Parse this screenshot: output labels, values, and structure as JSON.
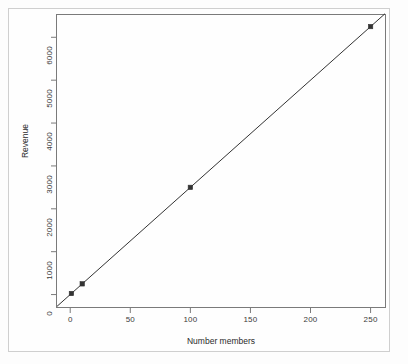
{
  "chart_data": {
    "type": "scatter",
    "title": "",
    "xlabel": "Number members",
    "ylabel": "Revenue",
    "xlim": [
      -11,
      262
    ],
    "ylim": [
      -290,
      6520
    ],
    "xticks": [
      "0",
      "50",
      "100",
      "150",
      "200",
      "250"
    ],
    "xtick_values": [
      0,
      50,
      100,
      150,
      200,
      250
    ],
    "yticks": [
      "0",
      "1000",
      "2000",
      "3000",
      "4000",
      "5000",
      "6000"
    ],
    "ytick_values": [
      0,
      1000,
      2000,
      3000,
      4000,
      5000,
      6000
    ],
    "grid": false,
    "legend": null,
    "series": [
      {
        "name": "Revenue",
        "x": [
          1,
          10,
          100,
          250
        ],
        "y": [
          25,
          250,
          2500,
          6250
        ],
        "marker": "filled-square",
        "line": "solid",
        "color": "#333333"
      }
    ],
    "trendline": {
      "type": "linear",
      "slope": 25,
      "intercept": 0,
      "color": "#333333"
    }
  },
  "figure": {
    "frame_color": "#cfcfcf",
    "axis_color": "#7a7a7a",
    "data_color": "#333333",
    "background": "#fefefe"
  }
}
